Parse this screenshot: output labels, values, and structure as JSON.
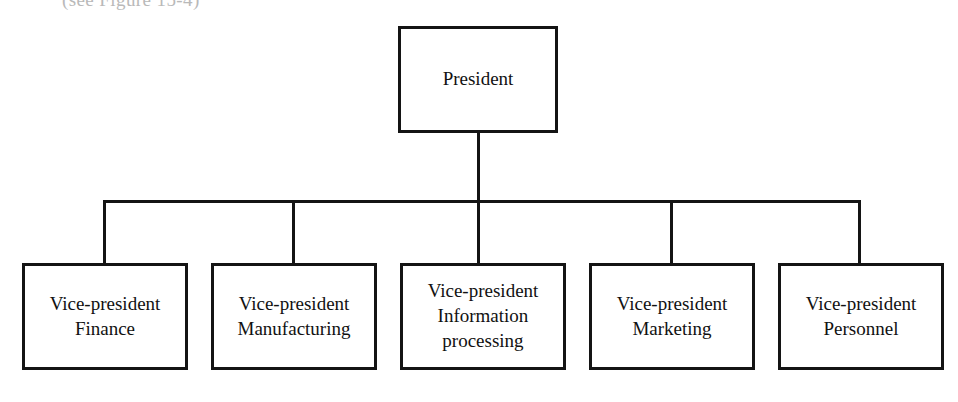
{
  "page": {
    "caption_fragment": "(see Figure 15-4)",
    "background_color": "#ffffff",
    "line_color": "#141414",
    "text_color": "#111111"
  },
  "chart_data": {
    "type": "diagram",
    "diagram_type": "organization-chart",
    "title": "",
    "root": {
      "id": "president",
      "label": "President"
    },
    "nodes": [
      {
        "id": "vp-finance",
        "label": "Vice-president\nFinance",
        "lines": [
          "Vice-president",
          "Finance"
        ]
      },
      {
        "id": "vp-manufacturing",
        "label": "Vice-president\nManufacturing",
        "lines": [
          "Vice-president",
          "Manufacturing"
        ]
      },
      {
        "id": "vp-information-processing",
        "label": "Vice-president\nInformation\nprocessing",
        "lines": [
          "Vice-president",
          "Information",
          "processing"
        ]
      },
      {
        "id": "vp-marketing",
        "label": "Vice-president\nMarketing",
        "lines": [
          "Vice-president",
          "Marketing"
        ]
      },
      {
        "id": "vp-personnel",
        "label": "Vice-president\nPersonnel",
        "lines": [
          "Vice-president",
          "Personnel"
        ]
      }
    ],
    "edges": [
      {
        "from": "president",
        "to": "vp-finance"
      },
      {
        "from": "president",
        "to": "vp-manufacturing"
      },
      {
        "from": "president",
        "to": "vp-information-processing"
      },
      {
        "from": "president",
        "to": "vp-marketing"
      },
      {
        "from": "president",
        "to": "vp-personnel"
      }
    ],
    "levels": 2,
    "orientation": "top-down"
  }
}
